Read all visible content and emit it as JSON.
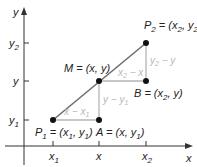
{
  "diagram": {
    "colors": {
      "axis": "#333333",
      "segment": "#6e6e6e",
      "guide": "#b5b5b5",
      "point": "#111111",
      "gray_label": "#b8b8b8"
    },
    "axes": {
      "x_label": "x",
      "y_label": "y",
      "x_ticks": [
        {
          "label": "x",
          "sub": "1"
        },
        {
          "label": "x",
          "sub": ""
        },
        {
          "label": "x",
          "sub": "2"
        }
      ],
      "y_ticks": [
        {
          "label": "y",
          "sub": "2"
        },
        {
          "label": "y",
          "sub": ""
        },
        {
          "label": "y",
          "sub": "1"
        }
      ]
    },
    "points": {
      "P1": {
        "name": "P",
        "sub": "1",
        "coords_text": "= (x",
        "coords_sub1": "1",
        "coords_mid": ", y",
        "coords_sub2": "1",
        "coords_end": ")"
      },
      "P2": {
        "name": "P",
        "sub": "2",
        "coords_text": "= (x",
        "coords_sub1": "2",
        "coords_mid": ", y",
        "coords_sub2": "2",
        "coords_end": ")"
      },
      "M": {
        "text": "M = (x, y)"
      },
      "A": {
        "text_pre": "A = (x, y",
        "sub": "1",
        "text_end": ")"
      },
      "B": {
        "text_pre": "B = (x",
        "sub": "2",
        "text_end": ", y)"
      }
    },
    "segment_labels": {
      "lower_horizontal": {
        "pre": "x − x",
        "sub": "1"
      },
      "lower_vertical": {
        "pre": "y − y",
        "sub": "1"
      },
      "upper_horizontal": {
        "pre": "x",
        "sub": "2",
        "post": " − x"
      },
      "upper_vertical": {
        "pre": "y",
        "sub": "2",
        "post": " − y"
      }
    }
  }
}
